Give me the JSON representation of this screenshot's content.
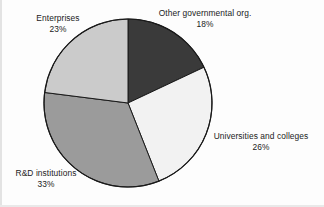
{
  "chart_data": {
    "type": "pie",
    "title": "",
    "subtitle": "",
    "xlabel": "",
    "ylabel": "",
    "legend_position": "none",
    "grid": false,
    "start_angle_deg": 0,
    "direction": "clockwise",
    "value_unit": "percent",
    "categories": [
      "Other governmental org.",
      "Universities and colleges",
      "R&D institutions",
      "Enterprises"
    ],
    "values": [
      18,
      26,
      33,
      23
    ],
    "slices": [
      {
        "label": "Other governmental org.",
        "value": 18,
        "value_text": "18%",
        "color": "#3a3a3a",
        "start_deg": 0,
        "end_deg": 64.8
      },
      {
        "label": "Universities and colleges",
        "value": 26,
        "value_text": "26%",
        "color": "#f2f2f2",
        "start_deg": 64.8,
        "end_deg": 158.4
      },
      {
        "label": "R&D institutions",
        "value": 33,
        "value_text": "33%",
        "color": "#9b9b9b",
        "start_deg": 158.4,
        "end_deg": 277.2
      },
      {
        "label": "Enterprises",
        "value": 23,
        "value_text": "23%",
        "color": "#cbcbcb",
        "start_deg": 277.2,
        "end_deg": 360
      }
    ],
    "annotations": [
      {
        "name": "enterprises",
        "text": "Enterprises",
        "value_text": "23%"
      },
      {
        "name": "other-governmental-org",
        "text": "Other governmental org.",
        "value_text": "18%"
      },
      {
        "name": "universities-and-colleges",
        "text": "Universities and colleges",
        "value_text": "26%"
      },
      {
        "name": "rd-institutions",
        "text": "R&D institutions",
        "value_text": "33%"
      }
    ]
  },
  "colors": {
    "background": "#fdfdfd",
    "outline": "#1a1a1a",
    "text": "#1b1b1b",
    "slice_other_gov": "#3a3a3a",
    "slice_universities": "#f2f2f2",
    "slice_rd": "#9b9b9b",
    "slice_enterprises": "#cbcbcb"
  },
  "geometry": {
    "center_x": 128,
    "center_y": 103,
    "radius": 84
  }
}
